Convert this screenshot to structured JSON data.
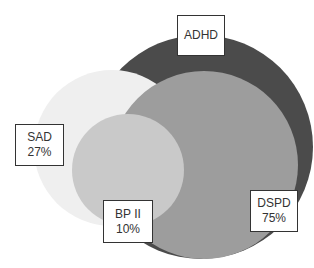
{
  "diagram": {
    "type": "overlapping-circles",
    "sets": [
      {
        "id": "adhd",
        "name": "ADHD",
        "value": "",
        "color": "#4b4b4b",
        "cx": 201,
        "cy": 147,
        "r": 112
      },
      {
        "id": "dspd",
        "name": "DSPD",
        "value": "75%",
        "color": "#9d9d9d",
        "cx": 204,
        "cy": 165,
        "r": 94
      },
      {
        "id": "sad",
        "name": "SAD",
        "value": "27%",
        "color": "#efefef",
        "cx": 112,
        "cy": 148,
        "r": 78
      },
      {
        "id": "bp2",
        "name": "BP II",
        "value": "10%",
        "color": "#c9c9c9",
        "cx": 128,
        "cy": 170,
        "r": 56
      }
    ],
    "labels": {
      "adhd": {
        "name": "ADHD"
      },
      "sad": {
        "name": "SAD",
        "value": "27%"
      },
      "bp2": {
        "name": "BP II",
        "value": "10%"
      },
      "dspd": {
        "name": "DSPD",
        "value": "75%"
      }
    }
  }
}
